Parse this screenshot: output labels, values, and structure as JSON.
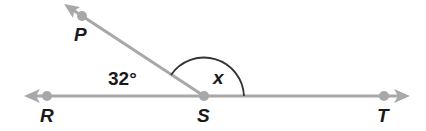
{
  "diagram": {
    "type": "angle-diagram",
    "colors": {
      "ray": "#a8a8a8",
      "point": "#a8a8a8",
      "arc": "#333333",
      "text": "#1a1a1a"
    },
    "points": [
      {
        "id": "P",
        "label": "P",
        "x": 82,
        "y": 16
      },
      {
        "id": "R",
        "label": "R",
        "x": 47,
        "y": 96
      },
      {
        "id": "S",
        "label": "S",
        "x": 204,
        "y": 96
      },
      {
        "id": "T",
        "label": "T",
        "x": 384,
        "y": 96
      }
    ],
    "rays": [
      {
        "from": "S",
        "through": "P"
      },
      {
        "from": "S",
        "through": "R"
      },
      {
        "from": "S",
        "through": "T"
      }
    ],
    "angles": [
      {
        "name": "angle-PSR",
        "label": "32°",
        "value_deg": 32
      },
      {
        "name": "angle-PST",
        "label": "x",
        "value_deg": null
      }
    ]
  },
  "labels": {
    "P": "P",
    "R": "R",
    "S": "S",
    "T": "T",
    "angle_known": "32°",
    "angle_unknown": "x"
  }
}
